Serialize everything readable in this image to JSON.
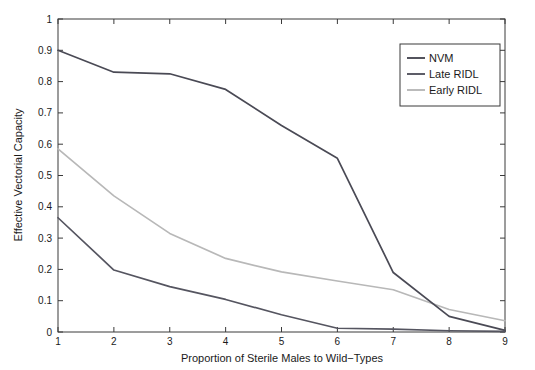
{
  "chart_data": {
    "type": "line",
    "title": "",
    "xlabel": "Proportion of Sterile Males to Wild−Types",
    "ylabel": "Effective Vectorial Capacity",
    "xlim": [
      1,
      9
    ],
    "ylim": [
      0,
      1
    ],
    "grid": false,
    "legend_position": "top-right",
    "x": [
      1,
      2,
      3,
      4,
      5,
      6,
      7,
      8,
      9
    ],
    "xticks": [
      "1",
      "2",
      "3",
      "4",
      "5",
      "6",
      "7",
      "8",
      "9"
    ],
    "yticks": [
      "0",
      "0.1",
      "0.2",
      "0.3",
      "0.4",
      "0.5",
      "0.6",
      "0.7",
      "0.8",
      "0.9",
      "1"
    ],
    "series": [
      {
        "name": "NVM",
        "color": "#4a4a55",
        "values": [
          0.9,
          0.83,
          0.825,
          0.775,
          0.66,
          0.555,
          0.19,
          0.05,
          0.005
        ]
      },
      {
        "name": "Late RIDL",
        "color": "#555560",
        "values": [
          0.365,
          0.198,
          0.145,
          0.104,
          0.055,
          0.012,
          0.009,
          0.004,
          0.002
        ]
      },
      {
        "name": "Early RIDL",
        "color": "#b8b8b8",
        "values": [
          0.585,
          0.435,
          0.315,
          0.235,
          0.192,
          0.163,
          0.135,
          0.072,
          0.036
        ]
      }
    ]
  },
  "legend": {
    "entries": [
      {
        "label": "NVM",
        "color": "#4a4a55"
      },
      {
        "label": "Late RIDL",
        "color": "#555560"
      },
      {
        "label": "Early RIDL",
        "color": "#b8b8b8"
      }
    ]
  },
  "axes": {
    "frame_color": "#3a3a3a",
    "background": "#ffffff"
  }
}
